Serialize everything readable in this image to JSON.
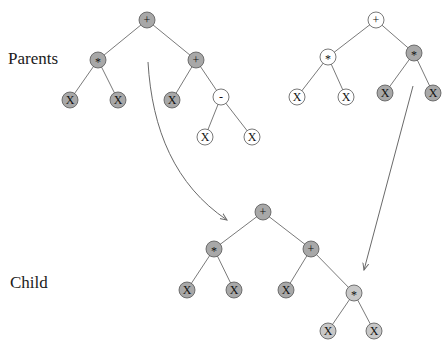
{
  "labels": {
    "parents": "Parents",
    "child": "Child"
  },
  "colors": {
    "gray_node": "#a8a8a8",
    "light_gray_node": "#c8c8c8",
    "white_node": "#ffffff",
    "edge": "#7a7a7a",
    "arrow": "#6a6a6a"
  },
  "trees": [
    {
      "id": "parent1",
      "nodes": [
        {
          "id": "p1_root",
          "sym": "+",
          "fill": "gray"
        },
        {
          "id": "p1_mul",
          "sym": "*",
          "fill": "gray"
        },
        {
          "id": "p1_add",
          "sym": "+",
          "fill": "gray"
        },
        {
          "id": "p1_x1",
          "sym": "X",
          "fill": "gray"
        },
        {
          "id": "p1_x2",
          "sym": "X",
          "fill": "gray"
        },
        {
          "id": "p1_x3",
          "sym": "X",
          "fill": "gray"
        },
        {
          "id": "p1_sub",
          "sym": "-",
          "fill": "white"
        },
        {
          "id": "p1_x4",
          "sym": "X",
          "fill": "white"
        },
        {
          "id": "p1_x5",
          "sym": "X",
          "fill": "white"
        }
      ],
      "edges": [
        [
          "p1_root",
          "p1_mul"
        ],
        [
          "p1_root",
          "p1_add"
        ],
        [
          "p1_mul",
          "p1_x1"
        ],
        [
          "p1_mul",
          "p1_x2"
        ],
        [
          "p1_add",
          "p1_x3"
        ],
        [
          "p1_add",
          "p1_sub"
        ],
        [
          "p1_sub",
          "p1_x4"
        ],
        [
          "p1_sub",
          "p1_x5"
        ]
      ]
    },
    {
      "id": "parent2",
      "nodes": [
        {
          "id": "p2_root",
          "sym": "+",
          "fill": "white"
        },
        {
          "id": "p2_mul1",
          "sym": "*",
          "fill": "white"
        },
        {
          "id": "p2_mul2",
          "sym": "*",
          "fill": "gray"
        },
        {
          "id": "p2_x1",
          "sym": "X",
          "fill": "white"
        },
        {
          "id": "p2_x2",
          "sym": "X",
          "fill": "white"
        },
        {
          "id": "p2_x3",
          "sym": "X",
          "fill": "gray"
        },
        {
          "id": "p2_x4",
          "sym": "X",
          "fill": "gray"
        }
      ],
      "edges": [
        [
          "p2_root",
          "p2_mul1"
        ],
        [
          "p2_root",
          "p2_mul2"
        ],
        [
          "p2_mul1",
          "p2_x1"
        ],
        [
          "p2_mul1",
          "p2_x2"
        ],
        [
          "p2_mul2",
          "p2_x3"
        ],
        [
          "p2_mul2",
          "p2_x4"
        ]
      ]
    },
    {
      "id": "child",
      "nodes": [
        {
          "id": "c_root",
          "sym": "+",
          "fill": "gray"
        },
        {
          "id": "c_mul",
          "sym": "*",
          "fill": "gray"
        },
        {
          "id": "c_add",
          "sym": "+",
          "fill": "gray"
        },
        {
          "id": "c_x1",
          "sym": "X",
          "fill": "gray"
        },
        {
          "id": "c_x2",
          "sym": "X",
          "fill": "gray"
        },
        {
          "id": "c_x3",
          "sym": "X",
          "fill": "gray"
        },
        {
          "id": "c_mul2",
          "sym": "*",
          "fill": "light"
        },
        {
          "id": "c_x4",
          "sym": "X",
          "fill": "light"
        },
        {
          "id": "c_x5",
          "sym": "X",
          "fill": "light"
        }
      ],
      "edges": [
        [
          "c_root",
          "c_mul"
        ],
        [
          "c_root",
          "c_add"
        ],
        [
          "c_mul",
          "c_x1"
        ],
        [
          "c_mul",
          "c_x2"
        ],
        [
          "c_add",
          "c_x3"
        ],
        [
          "c_add",
          "c_mul2"
        ],
        [
          "c_mul2",
          "c_x4"
        ],
        [
          "c_mul2",
          "c_x5"
        ]
      ]
    }
  ],
  "arrows": [
    {
      "id": "arrow-parent1-to-child",
      "from": "parent1",
      "to": "child",
      "style": "curved"
    },
    {
      "id": "arrow-parent2-to-child",
      "from": "parent2",
      "to": "child",
      "style": "straight"
    }
  ]
}
